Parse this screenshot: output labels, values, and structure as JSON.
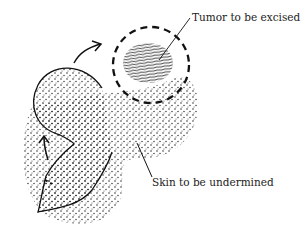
{
  "diagram": {
    "type": "surgical-flap-illustration",
    "labels": {
      "tumor": "Tumor to be excised",
      "skin": "Skin to be undermined"
    },
    "colors": {
      "ink": "#111111",
      "background": "#ffffff"
    }
  }
}
